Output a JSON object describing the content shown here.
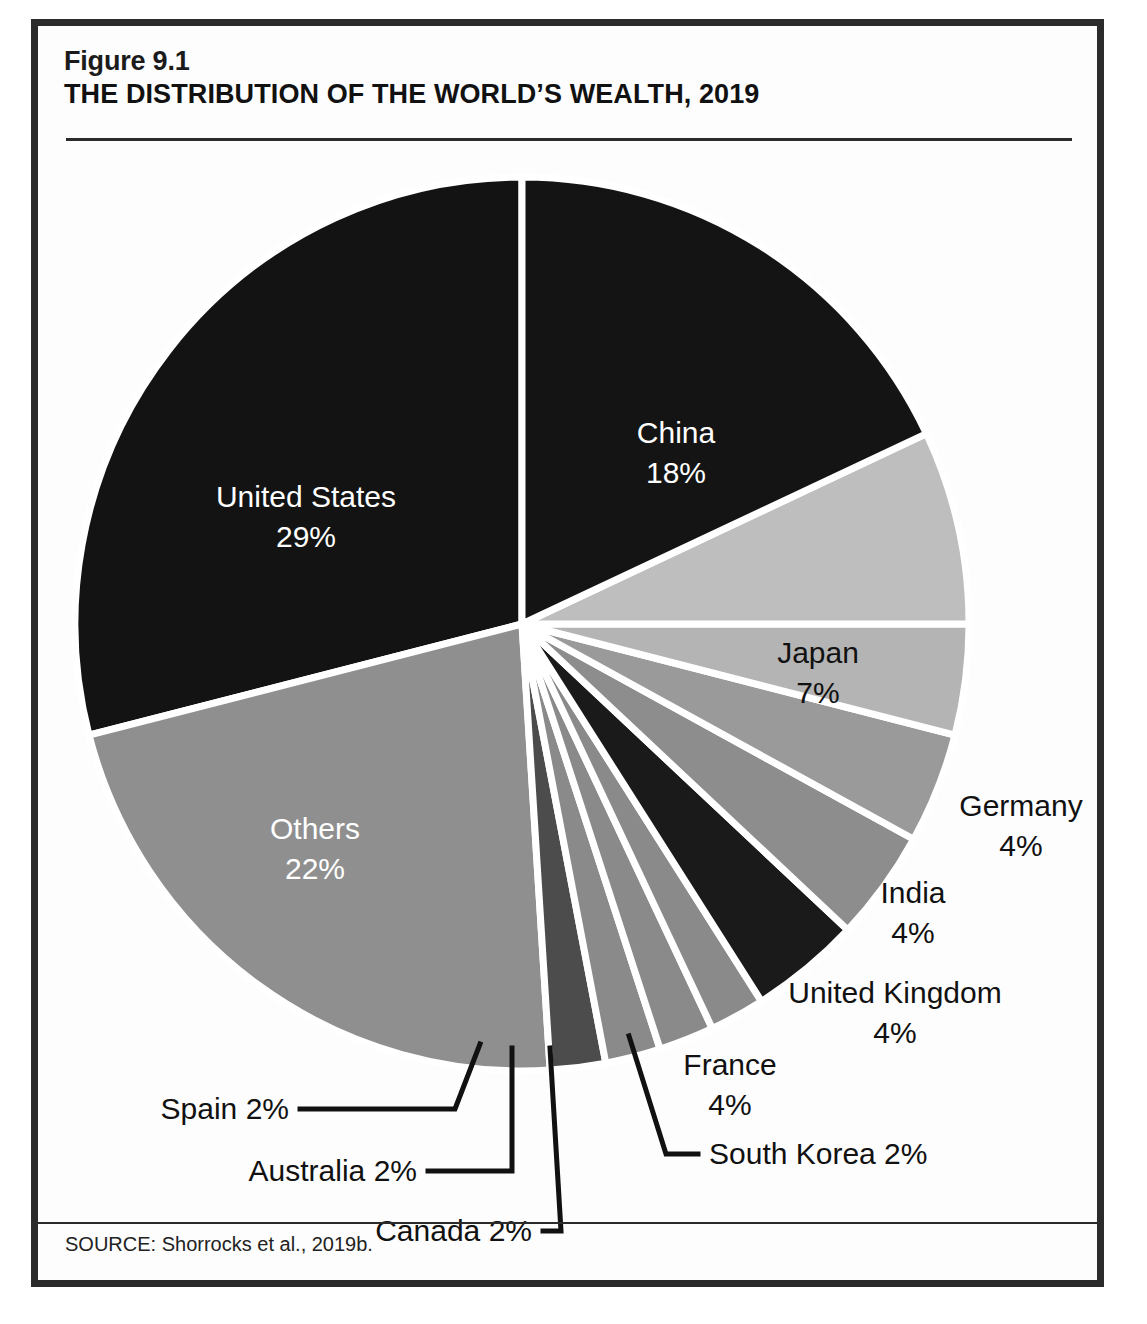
{
  "figure": {
    "number": "Figure 9.1",
    "title": "THE DISTRIBUTION OF THE WORLD’S WEALTH, 2019",
    "source": "SOURCE: Shorrocks et al., 2019b."
  },
  "chart_data": {
    "type": "pie",
    "subtitle": "Figure 9.1",
    "source": "SOURCE: Shorrocks et al., 2019b.",
    "unit": "percent",
    "legend": "none",
    "grid": false,
    "start_angle_deg": 0,
    "direction": "clockwise",
    "categories": [
      "China",
      "Japan",
      "Germany",
      "India",
      "United Kingdom",
      "France",
      "South Korea",
      "Canada",
      "Australia",
      "Spain",
      "Others",
      "United States"
    ],
    "values": [
      18,
      7,
      4,
      4,
      4,
      4,
      2,
      2,
      2,
      2,
      22,
      29
    ],
    "slices": [
      {
        "label": "China",
        "value": 18,
        "value_text": "18%",
        "color": "#141414",
        "text_color": "#ffffff",
        "label_placement": "inside"
      },
      {
        "label": "Japan",
        "value": 7,
        "value_text": "7%",
        "color": "#bebebe",
        "text_color": "#111111",
        "label_placement": "inside"
      },
      {
        "label": "Germany",
        "value": 4,
        "value_text": "4%",
        "color": "#b4b4b4",
        "text_color": "#111111",
        "label_placement": "outside"
      },
      {
        "label": "India",
        "value": 4,
        "value_text": "4%",
        "color": "#9a9a9a",
        "text_color": "#111111",
        "label_placement": "outside"
      },
      {
        "label": "United Kingdom",
        "value": 4,
        "value_text": "4%",
        "color": "#8d8d8d",
        "text_color": "#111111",
        "label_placement": "outside"
      },
      {
        "label": "France",
        "value": 4,
        "value_text": "4%",
        "color": "#1a1a1a",
        "text_color": "#111111",
        "label_placement": "outside"
      },
      {
        "label": "South Korea",
        "value": 2,
        "value_text": "2%",
        "color": "#8a8a8a",
        "text_color": "#111111",
        "label_placement": "callout"
      },
      {
        "label": "Canada",
        "value": 2,
        "value_text": "2%",
        "color": "#8a8a8a",
        "text_color": "#111111",
        "label_placement": "callout"
      },
      {
        "label": "Australia",
        "value": 2,
        "value_text": "2%",
        "color": "#8a8a8a",
        "text_color": "#111111",
        "label_placement": "callout"
      },
      {
        "label": "Spain",
        "value": 2,
        "value_text": "2%",
        "color": "#4c4c4c",
        "text_color": "#111111",
        "label_placement": "callout"
      },
      {
        "label": "Others",
        "value": 22,
        "value_text": "22%",
        "color": "#8f8f8f",
        "text_color": "#ffffff",
        "label_placement": "inside"
      },
      {
        "label": "United States",
        "value": 29,
        "value_text": "29%",
        "color": "#131313",
        "text_color": "#ffffff",
        "label_placement": "inside"
      }
    ]
  },
  "labels": {
    "china_name": "China",
    "china_value": "18%",
    "united_states_name": "United States",
    "united_states_value": "29%",
    "others_name": "Others",
    "others_value": "22%",
    "japan_name": "Japan",
    "japan_value": "7%",
    "germany_name": "Germany",
    "germany_value": "4%",
    "india_name": "India",
    "india_value": "4%",
    "uk_name": "United Kingdom",
    "uk_value": "4%",
    "france_name": "France",
    "france_value": "4%",
    "south_korea": "South Korea 2%",
    "canada": "Canada 2%",
    "australia": "Australia 2%",
    "spain": "Spain 2%"
  },
  "colors": {
    "frame": "#2b2b2b",
    "background": "#fdfdfd",
    "dark_slice": "#141414",
    "mid_slice": "#8f8f8f",
    "light_slice": "#bebebe",
    "separator": "#ffffff"
  }
}
